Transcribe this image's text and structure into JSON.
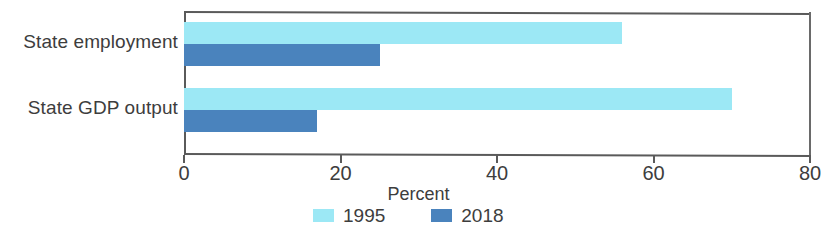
{
  "chart_data": {
    "type": "bar",
    "orientation": "horizontal",
    "title": "",
    "subtitle": "",
    "xlabel": "Percent",
    "ylabel": "",
    "categories": [
      "State employment",
      "State GDP output"
    ],
    "series": [
      {
        "name": "1995",
        "color": "#9ce8f5",
        "values": [
          56,
          70
        ]
      },
      {
        "name": "2018",
        "color": "#4a83bd",
        "values": [
          25,
          17
        ]
      }
    ],
    "xlim": [
      0,
      80
    ],
    "xticks": [
      0,
      20,
      40,
      60,
      80
    ],
    "xtick_labels": [
      "0",
      "20",
      "40",
      "60",
      "80"
    ],
    "grid": false,
    "legend_position": "bottom",
    "legend_entries": [
      "1995",
      "2018"
    ],
    "annotations": []
  },
  "axis": {
    "title": "Percent",
    "ticks": [
      {
        "label": "0",
        "value": 0
      },
      {
        "label": "20",
        "value": 20
      },
      {
        "label": "40",
        "value": 40
      },
      {
        "label": "60",
        "value": 60
      },
      {
        "label": "80",
        "value": 80
      }
    ]
  },
  "categories": [
    {
      "label": "State employment"
    },
    {
      "label": "State GDP output"
    }
  ],
  "legend": {
    "items": [
      {
        "label": "1995",
        "color": "#9ce8f5"
      },
      {
        "label": "2018",
        "color": "#4a83bd"
      }
    ]
  },
  "colors": {
    "series_1995": "#9ce8f5",
    "series_2018": "#4a83bd",
    "axis_line": "#5a5a5a",
    "text": "#3d3d3d",
    "background": "#ffffff"
  }
}
